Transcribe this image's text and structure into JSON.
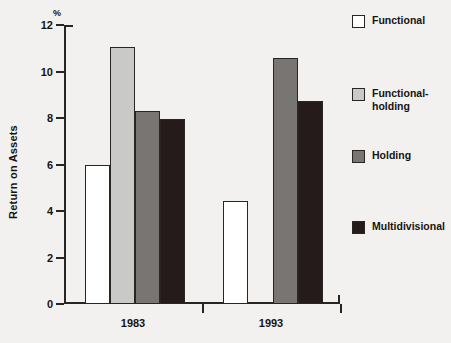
{
  "chart_data": {
    "type": "bar",
    "title": "",
    "xlabel": "",
    "ylabel": "Return on Assets",
    "unit": "%",
    "ylim": [
      0,
      12
    ],
    "yticks": [
      0,
      2,
      4,
      6,
      8,
      10,
      12
    ],
    "grid": false,
    "legend_position": "right",
    "categories": [
      "1983",
      "1993"
    ],
    "series": [
      {
        "name": "Functional",
        "color": "#ffffff",
        "values": [
          6.0,
          4.45
        ]
      },
      {
        "name": "Functional-\nholding",
        "color": "#c9c9c7",
        "values": [
          11.05,
          null
        ]
      },
      {
        "name": "Holding",
        "color": "#787573",
        "values": [
          8.3,
          10.6
        ]
      },
      {
        "name": "Multidivisional",
        "color": "#241b1a",
        "values": [
          7.95,
          8.75
        ]
      }
    ]
  },
  "axis": {
    "y_title": "Return on Assets",
    "percent_symbol": "%",
    "tick_labels": [
      "0",
      "2",
      "4",
      "6",
      "8",
      "10",
      "12"
    ]
  },
  "categories": [
    {
      "label": "1983"
    },
    {
      "label": "1993"
    }
  ],
  "legend": {
    "items": [
      {
        "label": "Functional",
        "color": "#ffffff"
      },
      {
        "label": "Functional-\nholding",
        "color": "#c9c9c7"
      },
      {
        "label": "Holding",
        "color": "#787573"
      },
      {
        "label": "Multidivisional",
        "color": "#241b1a"
      }
    ]
  }
}
